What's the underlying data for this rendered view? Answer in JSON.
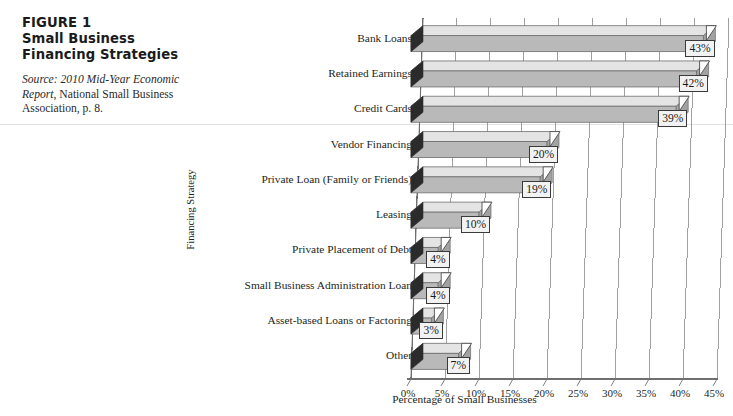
{
  "caption": {
    "figure_label": "FIGURE 1",
    "title": "Small Business Financing Strategies",
    "source_prefix": "Source:",
    "source_italic": "2010 Mid-Year Economic Report",
    "source_rest": ", National Small Business Association, p. 8."
  },
  "chart_data": {
    "type": "bar",
    "orientation": "horizontal",
    "title": "Small Business Financing Strategies",
    "xlabel": "Percentage of Small Businesses",
    "ylabel": "Financing Strategy",
    "categories": [
      "Bank Loans",
      "Retained Earnings",
      "Credit Cards",
      "Vendor Financing",
      "Private Loan (Family or Friends)",
      "Leasing",
      "Private Placement of Debt",
      "Small Business Administration Loan",
      "Asset-based Loans or Factoring",
      "Other"
    ],
    "values": [
      43,
      42,
      39,
      20,
      19,
      10,
      4,
      4,
      3,
      7
    ],
    "data_labels": [
      "43%",
      "42%",
      "39%",
      "20%",
      "19%",
      "10%",
      "4%",
      "4%",
      "3%",
      "7%"
    ],
    "xlim": [
      0,
      45
    ],
    "xticks": [
      0,
      5,
      10,
      15,
      20,
      25,
      30,
      35,
      40,
      45
    ],
    "xtick_labels": [
      "0%",
      "5%",
      "10%",
      "15%",
      "20%",
      "25%",
      "30%",
      "35%",
      "40%",
      "45%"
    ],
    "grid": true,
    "legend": "none",
    "style": "3d-bar",
    "colors": {
      "bar_front": "#b9b9b9",
      "bar_top": "#e4e4e4",
      "bar_end": "#2b2b2b",
      "grid": "#8f8f8f",
      "axis": "#6f6f6f",
      "callout_fill": "#f2f2f2",
      "callout_border": "#3a3a3a",
      "text": "#231f20"
    }
  }
}
